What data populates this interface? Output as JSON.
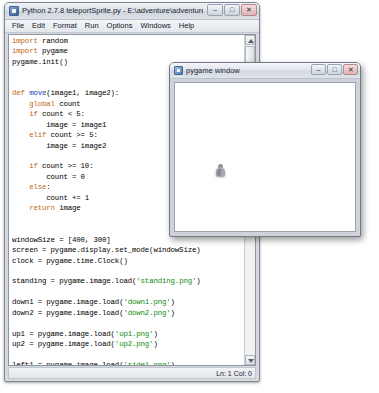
{
  "idle_window": {
    "title": "Python 2.7.8 teleportSprite.py - E:\\adventure\\adventure8\\teleport5...",
    "icon": "python-idle-icon",
    "controls": {
      "minimize": "–",
      "maximize": "□",
      "close": "✕"
    },
    "menu": [
      "File",
      "Edit",
      "Format",
      "Run",
      "Options",
      "Windows",
      "Help"
    ],
    "code": "import random\nimport pygame\npygame.init()\n\n\ndef move(image1, image2):\n    global count\n    if count < 5:\n        image = image1\n    elif count >= 5:\n        image = image2\n\n    if count >= 10:\n        count = 0\n    else:\n        count += 1\n    return image\n\n\nwindowSize = [400, 300]\nscreen = pygame.display.set_mode(windowSize)\nclock = pygame.time.Clock()\n\nstanding = pygame.image.load('standing.png')\n\ndown1 = pygame.image.load('down1.png')\ndown2 = pygame.image.load('down2.png')\n\nup1 = pygame.image.load('up1.png')\nup2 = pygame.image.load('up2.png')\n\nleft1 = pygame.image.load('side1.png')\nleft2 = pygame.image.load('side2.png')\n\nright1 = pygame.image.load('side1.png')\nright2 = pygame.image.load('side2.png')\nright1 = pygame.transform.flip(right1, True, Fa\nright2 = pygame.transform.flip(right2, True, Fa",
    "status": "Ln: 1 Col: 0"
  },
  "pygame_window": {
    "title": "pygame window",
    "icon": "pygame-window-icon",
    "controls": {
      "minimize": "–",
      "maximize": "□",
      "close": "✕"
    },
    "canvas": {
      "sprite": "character-sprite"
    }
  }
}
